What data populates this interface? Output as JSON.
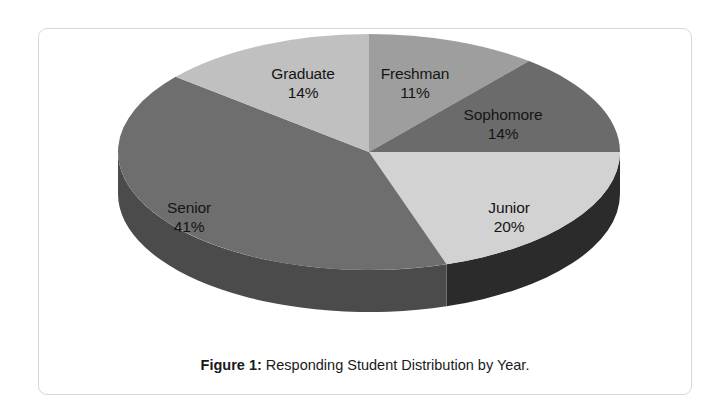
{
  "figure": {
    "caption_label": "Figure 1:",
    "caption_text": "Responding Student Distribution by Year."
  },
  "chart_data": {
    "type": "pie",
    "title": "Responding Student Distribution by Year.",
    "xlabel": "",
    "ylabel": "",
    "legend": "none",
    "grid": false,
    "three_d": true,
    "start_angle_deg": 0,
    "direction": "clockwise",
    "categories": [
      "Freshman",
      "Sophomore",
      "Junior",
      "Senior",
      "Graduate"
    ],
    "values": [
      11,
      14,
      20,
      41,
      14
    ],
    "value_unit": "%",
    "colors": [
      "#9e9e9e",
      "#6b6b6b",
      "#d2d2d2",
      "#6e6e6e",
      "#c0c0c0"
    ],
    "side_colors": [
      "#6d6d6d",
      "#4a4a4a",
      "#2b2b2b",
      "#4b4b4b",
      "#868686"
    ],
    "slices": [
      {
        "label": "Freshman",
        "value": 11,
        "value_text": "11%",
        "color": "#9e9e9e"
      },
      {
        "label": "Sophomore",
        "value": 14,
        "value_text": "14%",
        "color": "#6b6b6b"
      },
      {
        "label": "Junior",
        "value": 20,
        "value_text": "20%",
        "color": "#d2d2d2"
      },
      {
        "label": "Senior",
        "value": 41,
        "value_text": "41%",
        "color": "#6e6e6e"
      },
      {
        "label": "Graduate",
        "value": 14,
        "value_text": "14%",
        "color": "#c0c0c0"
      }
    ]
  },
  "labels": {
    "graduate": {
      "name": "Graduate",
      "value": "14%"
    },
    "freshman": {
      "name": "Freshman",
      "value": "11%"
    },
    "sophomore": {
      "name": "Sophomore",
      "value": "14%"
    },
    "junior": {
      "name": "Junior",
      "value": "20%"
    },
    "senior": {
      "name": "Senior",
      "value": "41%"
    }
  }
}
